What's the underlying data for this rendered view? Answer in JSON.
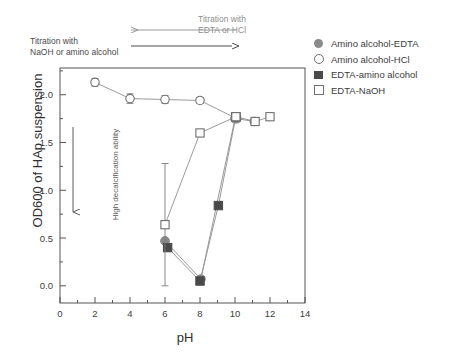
{
  "annotations": {
    "top_right": "Titration with\nEDTA or HCl",
    "top_left": "Titration with\nNaOH or amino alcohol",
    "vertical": "High decalcification ability"
  },
  "legend": {
    "items": [
      {
        "label": "Amino alcohol-EDTA",
        "marker": "circle-filled",
        "color": "#8a8a8a"
      },
      {
        "label": "Amino alcohol-HCl",
        "marker": "circle-open",
        "color": "#6f6f6f"
      },
      {
        "label": "EDTA-amino alcohol",
        "marker": "square-filled",
        "color": "#4a4a4a"
      },
      {
        "label": "EDTA-NaOH",
        "marker": "square-open",
        "color": "#6f6f6f"
      }
    ]
  },
  "chart_data": {
    "type": "scatter",
    "title": "",
    "xlabel": "pH",
    "ylabel": "OD600 of HAp suspension",
    "xlim": [
      0,
      14
    ],
    "ylim": [
      -0.18,
      2.28
    ],
    "xticks": [
      0,
      2,
      4,
      6,
      8,
      10,
      12,
      14
    ],
    "xtick_labels": [
      "0",
      "2",
      "4",
      "6",
      "8",
      "10",
      "12",
      "14"
    ],
    "yticks": [
      0.0,
      0.5,
      1.0,
      1.5,
      2.0
    ],
    "ytick_labels": [
      "0.0",
      "0.5",
      "1.0",
      "1.5",
      "2.0"
    ],
    "minor_xticks": [
      1,
      3,
      5,
      7,
      9,
      11,
      13
    ],
    "minor_yticks": [
      0.25,
      0.75,
      1.25,
      1.75,
      2.25
    ],
    "grid": false,
    "legend_position": "outside-right-top",
    "series": [
      {
        "name": "Amino alcohol-HCl",
        "marker": "circle-open",
        "color": "#6f6f6f",
        "x": [
          2.0,
          4.0,
          6.0,
          8.0,
          10.1,
          11.1
        ],
        "y": [
          2.13,
          1.96,
          1.95,
          1.94,
          1.75,
          1.72
        ],
        "yerr": [
          0.04,
          0.05,
          0.04,
          0.03,
          0.03,
          0.02
        ]
      },
      {
        "name": "Amino alcohol-EDTA",
        "marker": "circle-filled",
        "color": "#8a8a8a",
        "x": [
          6.0,
          8.05,
          10.0
        ],
        "y": [
          0.47,
          0.07,
          1.75
        ],
        "yerr": [
          0.0,
          0.0,
          0.0
        ]
      },
      {
        "name": "EDTA-amino alcohol",
        "marker": "square-filled",
        "color": "#4a4a4a",
        "x": [
          6.15,
          8.0,
          9.05,
          10.05
        ],
        "y": [
          0.4,
          0.05,
          0.84,
          1.77
        ],
        "yerr": [
          0.0,
          0.0,
          0.0,
          0.0
        ]
      },
      {
        "name": "EDTA-NaOH",
        "marker": "square-open",
        "color": "#6f6f6f",
        "x": [
          6.0,
          8.0,
          10.05,
          11.15,
          12.0
        ],
        "y": [
          0.64,
          1.6,
          1.77,
          1.72,
          1.77
        ],
        "yerr": [
          0.64,
          0.03,
          0.03,
          0.02,
          0.02
        ]
      }
    ]
  }
}
